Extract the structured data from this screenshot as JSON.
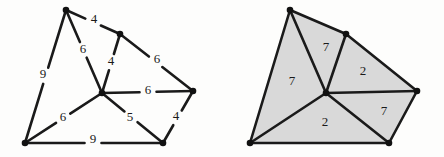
{
  "figure": {
    "background_color": "#fdfdfc",
    "edge_color": "#1a1a1a",
    "vertex_color": "#111111",
    "face_fill_color": "#d9d9d9"
  },
  "chart_data": {
    "type": "diagram",
    "title": "",
    "xlabel": "",
    "ylabel": "",
    "graphs": [
      {
        "name": "left-graph",
        "description": "Plane graph with edge weight labels",
        "vertices": [
          {
            "id": "A",
            "name": "top-vertex",
            "x": 66,
            "y": 10
          },
          {
            "id": "B",
            "name": "upper-mid-vertex",
            "x": 120,
            "y": 34
          },
          {
            "id": "C",
            "name": "center-vertex",
            "x": 102,
            "y": 93
          },
          {
            "id": "D",
            "name": "right-vertex",
            "x": 193,
            "y": 91
          },
          {
            "id": "E",
            "name": "bottom-left-vertex",
            "x": 25,
            "y": 143
          },
          {
            "id": "F",
            "name": "bottom-right-vertex",
            "x": 163,
            "y": 143
          }
        ],
        "edges": [
          {
            "from": "A",
            "to": "B",
            "label": "4",
            "label_x": 94,
            "label_y": 20
          },
          {
            "from": "A",
            "to": "C",
            "label": "6",
            "label_x": 83,
            "label_y": 50
          },
          {
            "from": "A",
            "to": "E",
            "label": "9",
            "label_x": 43,
            "label_y": 75
          },
          {
            "from": "B",
            "to": "C",
            "label": "4",
            "label_x": 111,
            "label_y": 62
          },
          {
            "from": "B",
            "to": "D",
            "label": "6",
            "label_x": 157,
            "label_y": 60
          },
          {
            "from": "C",
            "to": "D",
            "label": "6",
            "label_x": 148,
            "label_y": 91
          },
          {
            "from": "C",
            "to": "E",
            "label": "6",
            "label_x": 63,
            "label_y": 118
          },
          {
            "from": "C",
            "to": "F",
            "label": "5",
            "label_x": 130,
            "label_y": 118
          },
          {
            "from": "D",
            "to": "F",
            "label": "4",
            "label_x": 176,
            "label_y": 117
          },
          {
            "from": "E",
            "to": "F",
            "label": "9",
            "label_x": 93,
            "label_y": 140
          }
        ]
      },
      {
        "name": "right-graph",
        "description": "Plane graph with shaded faces and face labels",
        "vertices": [
          {
            "id": "A",
            "name": "top-vertex",
            "x": 290,
            "y": 10
          },
          {
            "id": "B",
            "name": "upper-mid-vertex",
            "x": 346,
            "y": 34
          },
          {
            "id": "C",
            "name": "center-vertex",
            "x": 326,
            "y": 93
          },
          {
            "id": "D",
            "name": "right-vertex",
            "x": 417,
            "y": 91
          },
          {
            "id": "E",
            "name": "bottom-left-vertex",
            "x": 250,
            "y": 143
          },
          {
            "id": "F",
            "name": "bottom-right-vertex",
            "x": 389,
            "y": 143
          }
        ],
        "edges": [
          {
            "from": "A",
            "to": "B"
          },
          {
            "from": "A",
            "to": "C"
          },
          {
            "from": "A",
            "to": "E"
          },
          {
            "from": "B",
            "to": "C"
          },
          {
            "from": "B",
            "to": "D"
          },
          {
            "from": "C",
            "to": "D"
          },
          {
            "from": "C",
            "to": "E"
          },
          {
            "from": "C",
            "to": "F"
          },
          {
            "from": "D",
            "to": "F"
          },
          {
            "from": "E",
            "to": "F"
          }
        ],
        "faces": [
          {
            "name": "face-left",
            "vertices": [
              "A",
              "C",
              "E"
            ],
            "label": "7",
            "label_x": 292,
            "label_y": 82
          },
          {
            "name": "face-top",
            "vertices": [
              "A",
              "B",
              "C"
            ],
            "label": "7",
            "label_x": 326,
            "label_y": 48
          },
          {
            "name": "face-right-upper",
            "vertices": [
              "B",
              "D",
              "C"
            ],
            "label": "2",
            "label_x": 363,
            "label_y": 72
          },
          {
            "name": "face-bottom",
            "vertices": [
              "C",
              "F",
              "E"
            ],
            "label": "2",
            "label_x": 325,
            "label_y": 123
          },
          {
            "name": "face-right-lower",
            "vertices": [
              "C",
              "D",
              "F"
            ],
            "label": "7",
            "label_x": 384,
            "label_y": 112
          }
        ]
      }
    ]
  }
}
